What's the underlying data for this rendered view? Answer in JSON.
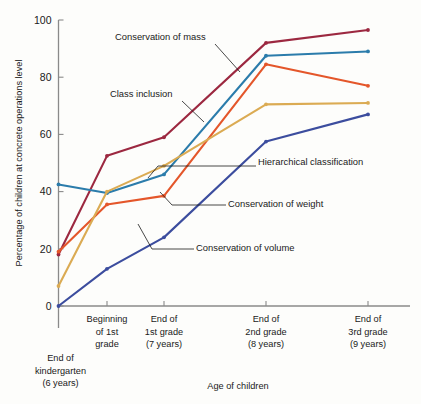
{
  "chart_data": {
    "type": "line",
    "title": "",
    "xlabel": "Age of children",
    "ylabel": "Percentage of children at concrete operations level",
    "ylim": [
      0,
      100
    ],
    "yticks": [
      0,
      20,
      40,
      60,
      80,
      100
    ],
    "grid": false,
    "legend_position": "inline-annotations",
    "categories": [
      "End of kindergarten (6 years)",
      "Beginning of 1st grade",
      "End of 1st grade (7 years)",
      "End of 2nd grade (8 years)",
      "End of 3rd grade (9 years)"
    ],
    "category_lines": [
      [
        "End of",
        "kindergarten",
        "(6 years)"
      ],
      [
        "Beginning",
        "of 1st",
        "grade"
      ],
      [
        "End of",
        "1st grade",
        "(7 years)"
      ],
      [
        "End of",
        "2nd grade",
        "(8 years)"
      ],
      [
        "End of",
        "3rd grade",
        "(9 years)"
      ]
    ],
    "series": [
      {
        "name": "Conservation of mass",
        "color": "#9c2840",
        "values": [
          18,
          52.5,
          59,
          92,
          96.5
        ]
      },
      {
        "name": "Class inclusion",
        "color": "#2b7cab",
        "values": [
          42.5,
          39.5,
          46,
          87.5,
          89
        ]
      },
      {
        "name": "Conservation of weight",
        "color": "#e4562a",
        "values": [
          19,
          35.5,
          38.5,
          84.5,
          77
        ]
      },
      {
        "name": "Hierarchical classification",
        "color": "#dbab53",
        "values": [
          7,
          40,
          49,
          70.5,
          71
        ]
      },
      {
        "name": "Conservation of volume",
        "color": "#3c4d9e",
        "values": [
          0,
          13,
          24,
          57.5,
          67
        ]
      }
    ],
    "annotations": [
      {
        "label": "Conservation of mass",
        "x": 115,
        "y": 40
      },
      {
        "label": "Class inclusion",
        "x": 110,
        "y": 97
      },
      {
        "label": "Hierarchical classification",
        "x": 258,
        "y": 165
      },
      {
        "label": "Conservation of weight",
        "x": 228,
        "y": 207
      },
      {
        "label": "Conservation of volume",
        "x": 196,
        "y": 251
      }
    ]
  },
  "axis": {
    "ytick_labels": [
      "0",
      "20",
      "40",
      "60",
      "80",
      "100"
    ],
    "y_axis_title": "Percentage of children at concrete operations level",
    "x_axis_title": "Age of children"
  }
}
